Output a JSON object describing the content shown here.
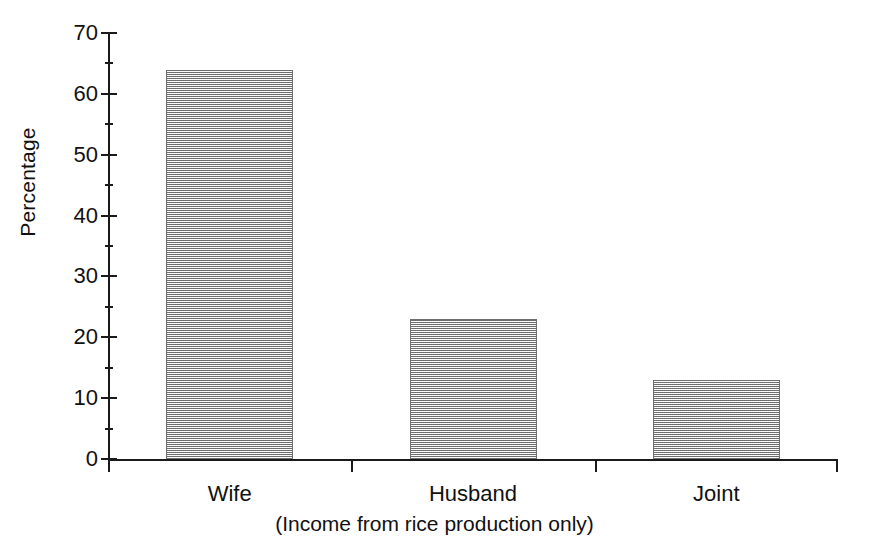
{
  "chart_data": {
    "type": "bar",
    "title": "",
    "subtitle": "",
    "categories": [
      "Wife",
      "Husband",
      "Joint"
    ],
    "values": [
      64,
      23,
      13
    ],
    "series": [
      {
        "name": "Percentage",
        "values": [
          64,
          23,
          13
        ]
      }
    ],
    "xlabel": "(Income from rice production only)",
    "ylabel": "Percentage",
    "ylim": [
      0,
      70
    ],
    "y_major_ticks": [
      0,
      10,
      20,
      30,
      40,
      50,
      60,
      70
    ],
    "y_minor_ticks": [
      5,
      15,
      25,
      35,
      45,
      55,
      65
    ],
    "y_tick_labels": [
      "0",
      "10",
      "20",
      "30",
      "40",
      "50",
      "60",
      "70"
    ],
    "grid": false,
    "legend": false,
    "legend_position": "none",
    "annotations": [],
    "bar_fill": "#c8c8c8",
    "bar_fill_style": "dither-checker-gray",
    "bar_edge_color": "#6f6f6f",
    "axis_color": "#1a1a1a",
    "background_color": "#ffffff"
  },
  "figure": {
    "y_axis_title": "Percentage",
    "x_axis_caption": "(Income from rice production only)"
  }
}
